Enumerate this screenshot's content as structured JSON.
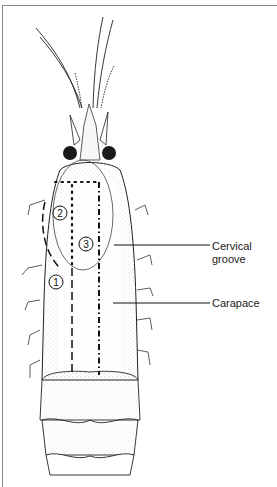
{
  "figure": {
    "labels": [
      {
        "id": "cervical_groove",
        "line1": "Cervical",
        "line2": "groove"
      },
      {
        "id": "carapace",
        "text": "Carapace"
      }
    ],
    "region_markers": [
      "1",
      "2",
      "3"
    ],
    "caption_partial": "Figure ... (cut off)"
  },
  "colors": {
    "ink": "#1a1a1a",
    "frame": "#8a8a8a",
    "background": "#ffffff"
  }
}
